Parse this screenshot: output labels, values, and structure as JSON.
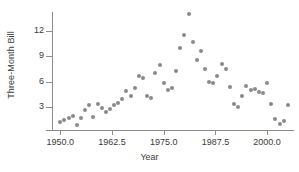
{
  "chart_data": {
    "type": "scatter",
    "title": "",
    "xlabel": "Year",
    "ylabel": "Three-Month Bill",
    "xlim": [
      1948.0,
      2006.5
    ],
    "ylim": [
      0.3,
      14.2
    ],
    "xticks": [
      1950.0,
      1962.5,
      1975.0,
      1987.5,
      2000.0
    ],
    "xtick_labels": [
      "1950.0",
      "1962.5",
      "1975.0",
      "1987.5",
      "2000.0"
    ],
    "yticks": [
      3,
      6,
      9,
      12
    ],
    "ytick_labels": [
      "3",
      "6",
      "9",
      "12"
    ],
    "grid": false,
    "legend": null,
    "marker_color": "#8a8a8a",
    "axis_color": "#8d8d8d",
    "x": [
      1950,
      1951,
      1952,
      1953,
      1954,
      1955,
      1956,
      1957,
      1958,
      1959,
      1960,
      1961,
      1962,
      1963,
      1964,
      1965,
      1966,
      1967,
      1968,
      1969,
      1970,
      1971,
      1972,
      1973,
      1974,
      1975,
      1976,
      1977,
      1978,
      1979,
      1980,
      1981,
      1982,
      1983,
      1984,
      1985,
      1986,
      1987,
      1988,
      1989,
      1990,
      1991,
      1992,
      1993,
      1994,
      1995,
      1996,
      1997,
      1998,
      1999,
      2000,
      2001,
      2002,
      2003,
      2004,
      2005
    ],
    "y": [
      1.2,
      1.5,
      1.7,
      1.9,
      0.9,
      1.7,
      2.6,
      3.2,
      1.8,
      3.4,
      2.9,
      2.4,
      2.8,
      3.2,
      3.5,
      3.9,
      4.9,
      4.3,
      5.3,
      6.7,
      6.4,
      4.3,
      4.1,
      7.0,
      7.9,
      5.8,
      5.0,
      5.3,
      7.2,
      10.0,
      11.5,
      14.0,
      10.7,
      8.6,
      9.6,
      7.5,
      6.0,
      5.8,
      6.7,
      8.1,
      7.5,
      5.4,
      3.4,
      3.0,
      4.3,
      5.5,
      5.0,
      5.1,
      4.8,
      4.7,
      5.8,
      3.4,
      1.6,
      1.0,
      1.4,
      3.2
    ]
  }
}
